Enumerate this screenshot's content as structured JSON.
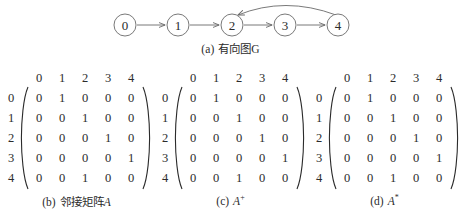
{
  "figure": {
    "graph": {
      "caption_index": "(a)",
      "caption_text": "有向图G",
      "nodes": [
        {
          "id": "0",
          "label": "0",
          "cx": 125,
          "cy": 25
        },
        {
          "id": "1",
          "label": "1",
          "cx": 178,
          "cy": 25
        },
        {
          "id": "2",
          "label": "2",
          "cx": 232,
          "cy": 25
        },
        {
          "id": "3",
          "label": "3",
          "cx": 285,
          "cy": 25
        },
        {
          "id": "4",
          "label": "4",
          "cx": 338,
          "cy": 25
        }
      ],
      "edges": [
        {
          "from": "0",
          "to": "1",
          "style": "straight"
        },
        {
          "from": "1",
          "to": "2",
          "style": "straight"
        },
        {
          "from": "2",
          "to": "3",
          "style": "straight"
        },
        {
          "from": "3",
          "to": "4",
          "style": "straight"
        },
        {
          "from": "4",
          "to": "2",
          "style": "curved"
        }
      ],
      "node_radius": 11,
      "stroke_color": "#6a6a6a"
    },
    "matrices": [
      {
        "caption_index": "(b)",
        "caption_text": "邻接矩阵",
        "caption_symbol": "A",
        "caption_superscript": "",
        "col_headers": [
          "0",
          "1",
          "2",
          "3",
          "4"
        ],
        "row_headers": [
          "0",
          "1",
          "2",
          "3",
          "4"
        ],
        "rows": [
          [
            "0",
            "1",
            "0",
            "0",
            "0"
          ],
          [
            "0",
            "0",
            "1",
            "0",
            "0"
          ],
          [
            "0",
            "0",
            "0",
            "1",
            "0"
          ],
          [
            "0",
            "0",
            "0",
            "0",
            "1"
          ],
          [
            "0",
            "0",
            "1",
            "0",
            "0"
          ]
        ]
      },
      {
        "caption_index": "(c)",
        "caption_text": "",
        "caption_symbol": "A",
        "caption_superscript": "+",
        "col_headers": [
          "0",
          "1",
          "2",
          "3",
          "4"
        ],
        "row_headers": [
          "0",
          "1",
          "2",
          "3",
          "4"
        ],
        "rows": [
          [
            "0",
            "1",
            "0",
            "0",
            "0"
          ],
          [
            "0",
            "0",
            "1",
            "0",
            "0"
          ],
          [
            "0",
            "0",
            "0",
            "1",
            "0"
          ],
          [
            "0",
            "0",
            "0",
            "0",
            "1"
          ],
          [
            "0",
            "0",
            "1",
            "0",
            "0"
          ]
        ]
      },
      {
        "caption_index": "(d)",
        "caption_text": "",
        "caption_symbol": "A",
        "caption_superscript": "*",
        "col_headers": [
          "0",
          "1",
          "2",
          "3",
          "4"
        ],
        "row_headers": [
          "0",
          "1",
          "2",
          "3",
          "4"
        ],
        "rows": [
          [
            "0",
            "1",
            "0",
            "0",
            "0"
          ],
          [
            "0",
            "0",
            "1",
            "0",
            "0"
          ],
          [
            "0",
            "0",
            "0",
            "1",
            "0"
          ],
          [
            "0",
            "0",
            "0",
            "0",
            "1"
          ],
          [
            "0",
            "0",
            "1",
            "0",
            "0"
          ]
        ]
      }
    ]
  }
}
